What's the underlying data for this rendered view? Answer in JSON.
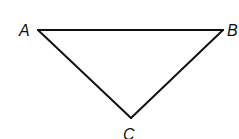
{
  "diagram": {
    "type": "triangle",
    "vertices": [
      {
        "id": "A",
        "label": "A",
        "x": 38,
        "y": 30
      },
      {
        "id": "B",
        "label": "B",
        "x": 223,
        "y": 30
      },
      {
        "id": "C",
        "label": "C",
        "x": 131,
        "y": 118
      }
    ],
    "edges": [
      {
        "from": "A",
        "to": "B"
      },
      {
        "from": "B",
        "to": "C"
      },
      {
        "from": "C",
        "to": "A"
      }
    ],
    "colors": {
      "stroke": "#111111",
      "background": "#ffffff"
    }
  }
}
